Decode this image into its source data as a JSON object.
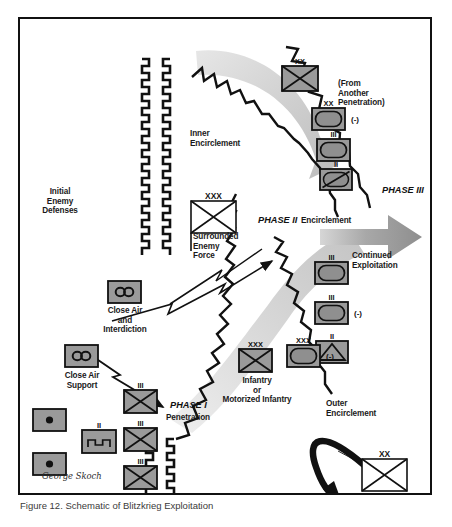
{
  "figure": {
    "caption": "Figure 12. Schematic of Blitzkrieg Exploitation",
    "artist_signature": "George Skoch",
    "border_color": "#111111",
    "background_color": "#ffffff",
    "unit_fill_color": "#9a9a9a",
    "arrow_gray": "#b8b8b8",
    "phase3_arrow_color": "#8c8c8c"
  },
  "labels": {
    "initial_enemy_defenses": "Initial\nEnemy\nDefenses",
    "inner_encirclement": "Inner\nEncirclement",
    "outer_encirclement": "Outer\nEncirclement",
    "from_another_penetration": "(From\nAnother\nPenetration)",
    "surrounded_enemy_force": "Surrounded\nEnemy\nForce",
    "close_air_and_interdiction": "Close Air\nand\nInterdiction",
    "close_air_support": "Close Air\nSupport",
    "infantry_or_motorized": "Infantry\nor\nMotorized Infantry",
    "continued_exploitation": "Continued\nExploitation",
    "defenders_efforts": "Defender's Efforts to\nBreak Encirclement",
    "encirclement": "Encirclement",
    "penetration": "Penetration"
  },
  "phases": {
    "phase1": "PHASE I",
    "phase2": "PHASE II",
    "phase3": "PHASE III"
  },
  "echelons": {
    "division": "XX",
    "corps": "XXX",
    "regiment": "III",
    "battalion": "II",
    "reduced": "(-)"
  },
  "units": [
    {
      "id": "inf-div-top",
      "name": "infantry-division-top",
      "echelon": "XX",
      "type": "infantry",
      "x": 262,
      "y": 47,
      "w": 36,
      "h": 25,
      "reduced": false
    },
    {
      "id": "armor-div",
      "name": "armor-division",
      "echelon": "XX",
      "type": "armor",
      "x": 292,
      "y": 89,
      "w": 33,
      "h": 22,
      "reduced": true
    },
    {
      "id": "armor-regt-inner",
      "name": "armor-regiment-inner",
      "echelon": "III",
      "type": "armor",
      "x": 297,
      "y": 120,
      "w": 33,
      "h": 22,
      "reduced": false
    },
    {
      "id": "recon-inner",
      "name": "recon-squadron-inner",
      "echelon": "II",
      "type": "recon",
      "x": 300,
      "y": 150,
      "w": 32,
      "h": 21,
      "reduced": false
    },
    {
      "id": "armor-phase2",
      "name": "armor-unit-phase2",
      "echelon": "III",
      "type": "armor",
      "x": 295,
      "y": 243,
      "w": 33,
      "h": 22,
      "reduced": false
    },
    {
      "id": "armor-phase2b",
      "name": "armor-unit-phase2-reduced",
      "echelon": "III",
      "type": "armor",
      "x": 295,
      "y": 283,
      "w": 33,
      "h": 22,
      "reduced": true
    },
    {
      "id": "mtn-unit",
      "name": "mountain-unit",
      "echelon": "II",
      "type": "mountain",
      "x": 296,
      "y": 322,
      "w": 32,
      "h": 22,
      "reduced": false
    },
    {
      "id": "inf-corps-lower",
      "name": "infantry-corps-lower",
      "echelon": "XXX",
      "type": "infantry",
      "x": 219,
      "y": 330,
      "w": 33,
      "h": 23,
      "reduced": false
    },
    {
      "id": "armor-corps-lower",
      "name": "armor-corps-lower",
      "echelon": "XXX",
      "type": "armor",
      "x": 267,
      "y": 326,
      "w": 33,
      "h": 22,
      "reduced": true
    },
    {
      "id": "cas-interdiction",
      "name": "close-air-interdiction-symbol",
      "echelon": "",
      "type": "aviation",
      "x": 88,
      "y": 262,
      "w": 33,
      "h": 22,
      "reduced": false
    },
    {
      "id": "cas-support",
      "name": "close-air-support-symbol",
      "echelon": "",
      "type": "aviation",
      "x": 45,
      "y": 326,
      "w": 33,
      "h": 22,
      "reduced": false
    },
    {
      "id": "arty-1",
      "name": "artillery-unit-1",
      "echelon": "",
      "type": "artillery",
      "x": 13,
      "y": 390,
      "w": 33,
      "h": 22,
      "reduced": false
    },
    {
      "id": "arty-2",
      "name": "artillery-unit-2",
      "echelon": "",
      "type": "artillery",
      "x": 13,
      "y": 434,
      "w": 33,
      "h": 22,
      "reduced": false
    },
    {
      "id": "engineer",
      "name": "engineer-unit",
      "echelon": "II",
      "type": "engineer",
      "x": 62,
      "y": 411,
      "w": 34,
      "h": 23,
      "reduced": false
    },
    {
      "id": "inf-regt-1",
      "name": "infantry-regiment-1",
      "echelon": "III",
      "type": "infantry",
      "x": 104,
      "y": 371,
      "w": 33,
      "h": 23,
      "reduced": false
    },
    {
      "id": "inf-regt-2",
      "name": "infantry-regiment-2",
      "echelon": "III",
      "type": "infantry",
      "x": 104,
      "y": 409,
      "w": 33,
      "h": 23,
      "reduced": false
    },
    {
      "id": "inf-regt-3",
      "name": "infantry-regiment-3",
      "echelon": "III",
      "type": "infantry",
      "x": 104,
      "y": 447,
      "w": 33,
      "h": 23,
      "reduced": false
    },
    {
      "id": "surrounded-force",
      "name": "surrounded-enemy-force-symbol",
      "echelon": "XXX",
      "type": "infantry-white",
      "x": 171,
      "y": 182,
      "w": 45,
      "h": 32,
      "reduced": false
    },
    {
      "id": "defender-div",
      "name": "defender-division-symbol",
      "echelon": "XX",
      "type": "infantry-white",
      "x": 342,
      "y": 440,
      "w": 45,
      "h": 32,
      "reduced": false
    }
  ]
}
